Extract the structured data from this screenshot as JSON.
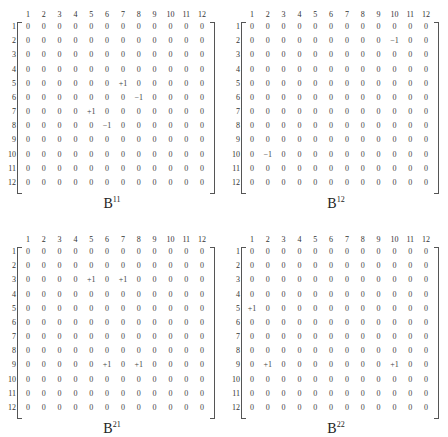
{
  "matrices": [
    {
      "id": "B11",
      "label_base": "B",
      "label_sup": "11",
      "col_headers": [
        "1",
        "2",
        "3",
        "4",
        "5",
        "6",
        "7",
        "8",
        "9",
        "10",
        "11",
        "12"
      ],
      "row_headers": [
        "1",
        "2",
        "3",
        "4",
        "5",
        "6",
        "7",
        "8",
        "9",
        "10",
        "11",
        "12"
      ],
      "nonzero": [
        {
          "row": 5,
          "col": 7,
          "value": "+1"
        },
        {
          "row": 6,
          "col": 8,
          "value": "−1"
        },
        {
          "row": 7,
          "col": 5,
          "value": "+1"
        },
        {
          "row": 8,
          "col": 6,
          "value": "−1"
        }
      ]
    },
    {
      "id": "B12",
      "label_base": "B",
      "label_sup": "12",
      "col_headers": [
        "1",
        "2",
        "3",
        "4",
        "5",
        "6",
        "7",
        "8",
        "9",
        "10",
        "11",
        "12"
      ],
      "row_headers": [
        "1",
        "2",
        "3",
        "4",
        "5",
        "6",
        "7",
        "8",
        "9",
        "10",
        "11",
        "12"
      ],
      "nonzero": [
        {
          "row": 2,
          "col": 10,
          "value": "−1"
        },
        {
          "row": 10,
          "col": 2,
          "value": "−1"
        }
      ]
    },
    {
      "id": "B21",
      "label_base": "B",
      "label_sup": "21",
      "col_headers": [
        "1",
        "2",
        "3",
        "4",
        "5",
        "6",
        "7",
        "8",
        "9",
        "10",
        "11",
        "12"
      ],
      "row_headers": [
        "1",
        "2",
        "3",
        "4",
        "5",
        "6",
        "7",
        "8",
        "9",
        "10",
        "11",
        "12"
      ],
      "nonzero": [
        {
          "row": 3,
          "col": 5,
          "value": "+1"
        },
        {
          "row": 3,
          "col": 7,
          "value": "+1"
        },
        {
          "row": 9,
          "col": 6,
          "value": "+1"
        },
        {
          "row": 9,
          "col": 8,
          "value": "+1"
        }
      ]
    },
    {
      "id": "B22",
      "label_base": "B",
      "label_sup": "22",
      "col_headers": [
        "1",
        "2",
        "3",
        "4",
        "5",
        "6",
        "7",
        "8",
        "9",
        "10",
        "11",
        "12"
      ],
      "row_headers": [
        "1",
        "2",
        "3",
        "4",
        "5",
        "6",
        "7",
        "8",
        "9",
        "10",
        "11",
        "12"
      ],
      "nonzero": [
        {
          "row": 5,
          "col": 1,
          "value": "+1"
        },
        {
          "row": 9,
          "col": 2,
          "value": "+1"
        },
        {
          "row": 9,
          "col": 10,
          "value": "+1"
        }
      ]
    }
  ],
  "zero_value": "0"
}
